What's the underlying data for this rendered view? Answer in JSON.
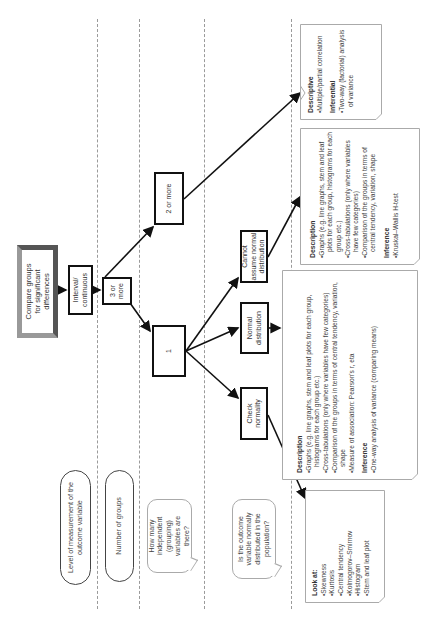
{
  "row_labels": {
    "level_of_measurement": "Level of measurement of the outcome variable",
    "number_of_groups": "Number of groups",
    "how_many_independent": "How many independent (grouping) variables are there?",
    "is_outcome_normal": "Is the outcome variable normally distributed in the population?"
  },
  "nodes": {
    "start": "Compare groups for significant differences",
    "interval": "Interval/ continuous",
    "three_or_more": "3 or more",
    "two_or_more": "2 or more",
    "one": "1",
    "cannot_assume": "Cannot assume normal distribution",
    "normal_distribution": "Normal distribution",
    "check_normality": "Check normality"
  },
  "panels": {
    "two_or_more": {
      "sections": [
        {
          "heading": "Descriptive",
          "items": [
            "Multiple/partial correlation"
          ]
        },
        {
          "heading": "Inferential",
          "items": [
            "Two-way (factorial) analysis of variance"
          ]
        }
      ]
    },
    "cannot_assume": {
      "sections": [
        {
          "heading": "Description",
          "items": [
            "Graphs (e.g. line graphs, stem and leaf plots for each group, histograms for each group etc.)",
            "Cross-tabulations (only where variables have few categories)",
            "Comparison of the groups in terms of central tendency, variation, shape"
          ]
        },
        {
          "heading": "Inference",
          "items": [
            "Kruskal–Wallis H-test"
          ]
        }
      ]
    },
    "normal_distribution": {
      "sections": [
        {
          "heading": "Description",
          "items": [
            "Graphs (e.g. line graphs, stem and leaf plots for each group, histograms for each group etc.)",
            "Cross-tabulations (only where variables have few categories)",
            "Comparison of the groups in terms of central tendency, variation, shape",
            "Measure of association: Pearson's r, eta"
          ]
        },
        {
          "heading": "Inference",
          "items": [
            "One-way analysis of variance (comparing means)"
          ]
        }
      ]
    },
    "check_normality": {
      "sections": [
        {
          "heading": "Look at:",
          "items": [
            "Skewness",
            "Kurtosis",
            "Central tendency",
            "Kolmogorov–Smirnov",
            "Histogram",
            "Stem and leaf plot"
          ]
        }
      ]
    }
  },
  "colors": {
    "line": "#111111",
    "dashed_divider": "#9a9a9a",
    "panel_border": "#aaaaaa",
    "start_bevel": "#777777"
  }
}
